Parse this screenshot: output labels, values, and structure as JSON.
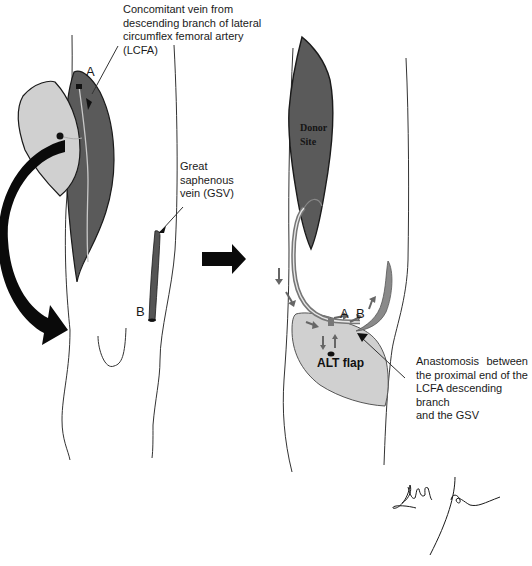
{
  "figure": {
    "left_panel": {
      "name": "before-transfer",
      "callouts": {
        "lcfa_vein": {
          "lines": [
            "Concomitant vein from",
            "descending branch of lateral",
            "circumflex femoral artery",
            "(LCFA)"
          ]
        },
        "gsv": {
          "lines": [
            "Great",
            "saphenous",
            "vein (GSV)"
          ]
        }
      },
      "markers": {
        "a": "A",
        "b": "B"
      }
    },
    "transition_arrow": "right-arrow-icon",
    "right_panel": {
      "name": "after-transfer",
      "donor_site_lines": [
        "Donor",
        "Site"
      ],
      "flap_label": "ALT flap",
      "markers": {
        "a": "A",
        "b": "B"
      },
      "callout": {
        "lines": [
          "Anastomosis between",
          "the proximal end of the",
          "LCFA descending branch",
          "and the GSV"
        ]
      }
    },
    "colors": {
      "muscle_dark": "#5a5a5a",
      "flap_light": "#d0d0d0",
      "vein_gray": "#7a7a7a",
      "outline": "#1a1a1a",
      "arrow_black": "#0a0a0a"
    },
    "signature": "handwritten-signature"
  }
}
